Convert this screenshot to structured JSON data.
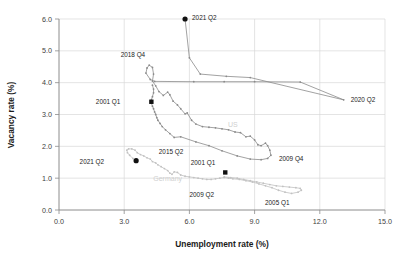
{
  "chart_data": {
    "type": "line",
    "title": "",
    "xlabel": "Unemployment rate (%)",
    "ylabel": "Vacancy rate (%)",
    "xlim": [
      0.0,
      15.0
    ],
    "ylim": [
      0.0,
      6.0
    ],
    "xticks": [
      "0.0",
      "3.0",
      "6.0",
      "9.0",
      "12.0",
      "15.0"
    ],
    "yticks": [
      "0.0",
      "1.0",
      "2.0",
      "3.0",
      "4.0",
      "5.0",
      "6.0"
    ],
    "grid": true,
    "legend_position": "inline-annotations",
    "colors": {
      "us_line": "#8a8a8a",
      "germany_line": "#c2c2c2",
      "marker_black": "#111111",
      "grid": "#d9d9d9",
      "axis": "#8c8c8c",
      "text": "#1b1b1b",
      "watermark": "#cfcfcf"
    },
    "series": [
      {
        "name": "US",
        "color": "#8a8a8a",
        "label_text": "US",
        "label_x": 8.0,
        "label_y": 2.62,
        "points": [
          [
            5.8,
            6.0
          ],
          [
            6.0,
            4.78
          ],
          [
            6.5,
            4.27
          ],
          [
            7.7,
            4.2
          ],
          [
            8.8,
            4.16
          ],
          [
            13.1,
            3.46
          ],
          [
            11.1,
            4.02
          ],
          [
            9.0,
            4.03
          ],
          [
            7.6,
            4.03
          ],
          [
            6.2,
            4.03
          ],
          [
            4.4,
            4.04
          ],
          [
            4.2,
            4.1
          ],
          [
            4.0,
            4.3
          ],
          [
            4.05,
            4.46
          ],
          [
            4.15,
            4.55
          ],
          [
            4.3,
            4.48
          ],
          [
            4.35,
            4.27
          ],
          [
            4.3,
            4.05
          ],
          [
            4.45,
            3.9
          ],
          [
            4.6,
            3.72
          ],
          [
            4.8,
            3.6
          ],
          [
            5.0,
            3.7
          ],
          [
            5.1,
            3.62
          ],
          [
            5.25,
            3.42
          ],
          [
            5.45,
            3.3
          ],
          [
            5.6,
            3.18
          ],
          [
            5.8,
            3.02
          ],
          [
            5.9,
            3.05
          ],
          [
            6.1,
            2.82
          ],
          [
            6.3,
            2.7
          ],
          [
            6.6,
            2.62
          ],
          [
            6.9,
            2.6
          ],
          [
            7.2,
            2.58
          ],
          [
            7.5,
            2.55
          ],
          [
            7.8,
            2.52
          ],
          [
            8.1,
            2.45
          ],
          [
            8.35,
            2.43
          ],
          [
            8.6,
            2.3
          ],
          [
            8.8,
            2.32
          ],
          [
            9.0,
            2.2
          ],
          [
            9.15,
            2.05
          ],
          [
            9.3,
            2.02
          ],
          [
            9.5,
            2.1
          ],
          [
            9.6,
            2.02
          ],
          [
            9.7,
            1.88
          ],
          [
            9.75,
            1.72
          ],
          [
            9.6,
            1.62
          ],
          [
            9.3,
            1.58
          ],
          [
            8.8,
            1.6
          ],
          [
            8.2,
            1.7
          ],
          [
            7.5,
            1.86
          ],
          [
            6.9,
            2.02
          ],
          [
            6.3,
            2.14
          ],
          [
            5.6,
            2.3
          ],
          [
            5.3,
            2.28
          ],
          [
            5.1,
            2.4
          ],
          [
            4.9,
            2.52
          ],
          [
            4.75,
            2.62
          ],
          [
            4.65,
            2.72
          ],
          [
            4.55,
            2.82
          ],
          [
            4.5,
            2.9
          ],
          [
            4.45,
            3.0
          ],
          [
            4.4,
            3.08
          ],
          [
            4.35,
            3.18
          ],
          [
            4.3,
            3.26
          ],
          [
            4.25,
            3.36
          ],
          [
            4.25,
            3.46
          ],
          [
            4.3,
            3.56
          ],
          [
            4.35,
            3.68
          ],
          [
            4.35,
            3.8
          ],
          [
            4.3,
            3.92
          ]
        ],
        "annotations": [
          {
            "text": "2021 Q2",
            "x": 5.8,
            "y": 6.0,
            "marker": "circle",
            "marker_color": "#111111",
            "dx": 7,
            "dy": 1
          },
          {
            "text": "2018 Q4",
            "x": 4.15,
            "y": 4.55,
            "marker": "none",
            "dx": -4,
            "dy": -8
          },
          {
            "text": "2001 Q1",
            "x": 4.25,
            "y": 3.4,
            "marker": "square",
            "marker_color": "#111111",
            "dx": -31,
            "dy": 2
          },
          {
            "text": "2020 Q2",
            "x": 13.1,
            "y": 3.46,
            "marker": "none",
            "dx": 7,
            "dy": 2
          },
          {
            "text": "2009 Q4",
            "x": 9.75,
            "y": 1.72,
            "marker": "none",
            "dx": 8,
            "dy": 6
          }
        ]
      },
      {
        "name": "Germany",
        "color": "#c2c2c2",
        "label_text": "Germany",
        "label_x": 5.0,
        "label_y": 0.92,
        "points": [
          [
            3.55,
            1.55
          ],
          [
            3.4,
            1.62
          ],
          [
            3.25,
            1.72
          ],
          [
            3.15,
            1.8
          ],
          [
            3.12,
            1.88
          ],
          [
            3.2,
            1.92
          ],
          [
            3.35,
            1.92
          ],
          [
            3.5,
            1.88
          ],
          [
            3.6,
            1.8
          ],
          [
            3.75,
            1.74
          ],
          [
            3.9,
            1.7
          ],
          [
            4.05,
            1.64
          ],
          [
            4.2,
            1.6
          ],
          [
            4.3,
            1.52
          ],
          [
            4.45,
            1.48
          ],
          [
            4.55,
            1.42
          ],
          [
            4.7,
            1.36
          ],
          [
            4.85,
            1.3
          ],
          [
            5.0,
            1.24
          ],
          [
            5.1,
            1.16
          ],
          [
            5.2,
            1.12
          ],
          [
            5.3,
            1.2
          ],
          [
            5.45,
            1.18
          ],
          [
            5.6,
            1.1
          ],
          [
            5.8,
            1.06
          ],
          [
            6.0,
            1.04
          ],
          [
            6.2,
            1.02
          ],
          [
            6.4,
            1.0
          ],
          [
            6.6,
            0.98
          ],
          [
            6.8,
            0.96
          ],
          [
            7.0,
            0.96
          ],
          [
            7.2,
            0.98
          ],
          [
            7.4,
            1.0
          ],
          [
            7.6,
            1.02
          ],
          [
            7.8,
            1.0
          ],
          [
            8.0,
            0.98
          ],
          [
            8.3,
            0.96
          ],
          [
            8.6,
            0.92
          ],
          [
            8.9,
            0.88
          ],
          [
            9.2,
            0.82
          ],
          [
            9.5,
            0.76
          ],
          [
            9.8,
            0.7
          ],
          [
            10.1,
            0.62
          ],
          [
            10.4,
            0.56
          ],
          [
            10.7,
            0.52
          ],
          [
            11.0,
            0.56
          ],
          [
            11.15,
            0.62
          ],
          [
            11.1,
            0.68
          ],
          [
            10.9,
            0.7
          ],
          [
            10.6,
            0.72
          ],
          [
            10.3,
            0.74
          ],
          [
            10.0,
            0.76
          ],
          [
            9.7,
            0.8
          ],
          [
            9.4,
            0.84
          ],
          [
            9.1,
            0.88
          ],
          [
            8.8,
            0.92
          ],
          [
            8.5,
            0.96
          ],
          [
            8.2,
            1.0
          ],
          [
            7.9,
            1.02
          ],
          [
            7.6,
            1.04
          ]
        ],
        "annotations": [
          {
            "text": "2021 Q2",
            "x": 3.55,
            "y": 1.55,
            "marker": "circle",
            "marker_color": "#111111",
            "dx": -32,
            "dy": 3
          },
          {
            "text": "2015 Q2",
            "x": 4.5,
            "y": 1.7,
            "marker": "none",
            "dx": 2,
            "dy": -2
          },
          {
            "text": "2001 Q1",
            "x": 7.65,
            "y": 1.18,
            "marker": "square",
            "marker_color": "#111111",
            "dx": -10,
            "dy": -7
          },
          {
            "text": "2009 Q2",
            "x": 7.5,
            "y": 0.72,
            "marker": "none",
            "dx": -8,
            "dy": 10
          },
          {
            "text": "2005 Q1",
            "x": 10.7,
            "y": 0.52,
            "marker": "none",
            "dx": -2,
            "dy": 12
          }
        ]
      }
    ]
  },
  "axes": {
    "x_title": "Unemployment rate (%)",
    "y_title": "Vacancy rate (%)"
  }
}
